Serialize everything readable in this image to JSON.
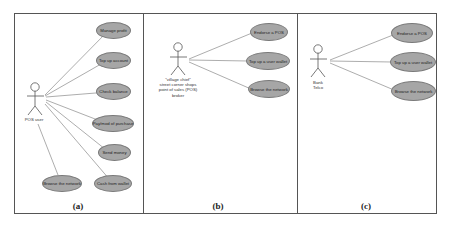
{
  "diagram": {
    "type": "uml-use-case",
    "colors": {
      "usecase_fill": "#a6a6a6",
      "usecase_border": "#7a7a7a",
      "line": "#8a8a8a",
      "frame": "#555555"
    },
    "panels": [
      {
        "caption": "(a)",
        "actor": {
          "label": "POS user"
        },
        "use_cases": [
          "Manage profit",
          "Top up account",
          "Check balance",
          "Pay/mod of purchase",
          "Send money",
          "Cash from wallet",
          "Browse the network"
        ]
      },
      {
        "caption": "(b)",
        "actor": {
          "label": "\"village chief\"\nstreet corner shops\npoint of sales (POS)\nbroker"
        },
        "use_cases": [
          "Endorse a POS",
          "Top up a user wallet",
          "Browse the network"
        ]
      },
      {
        "caption": "(c)",
        "actor": {
          "label": "Bank\nTelco"
        },
        "use_cases": [
          "Endorse a POS",
          "Top up a user wallet",
          "Browse the network"
        ]
      }
    ]
  }
}
